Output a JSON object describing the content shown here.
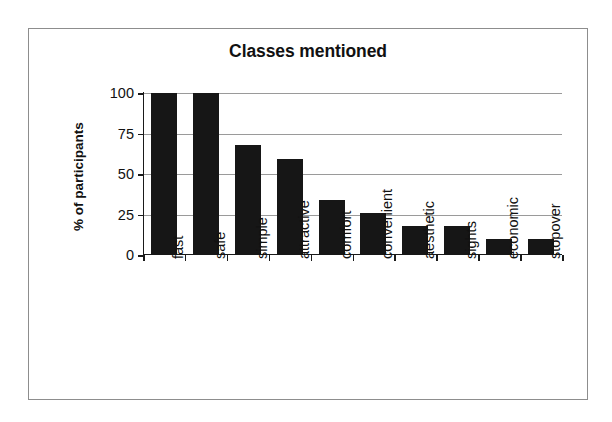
{
  "chart_data": {
    "type": "bar",
    "title": "Classes mentioned",
    "xlabel": "",
    "ylabel": "% of participants",
    "categories": [
      "fast",
      "safe",
      "simple",
      "attractive",
      "comfort",
      "convenient",
      "aesthetic",
      "sights",
      "economic",
      "stopover"
    ],
    "values": [
      100,
      100,
      68,
      59,
      34,
      26,
      18,
      18,
      10,
      10
    ],
    "ylim": [
      0,
      100
    ],
    "yticks": [
      0,
      25,
      50,
      75,
      100
    ],
    "ytick_labels": [
      "0",
      "25",
      "50",
      "75",
      "100"
    ],
    "grid": "horizontal",
    "legend": "none",
    "bar_color": "#161616",
    "axis_color": "#1a1a1a",
    "gridline_color": "#9a9a9a",
    "frame_color": "#8d8d8d",
    "background_color": "#ffffff"
  }
}
